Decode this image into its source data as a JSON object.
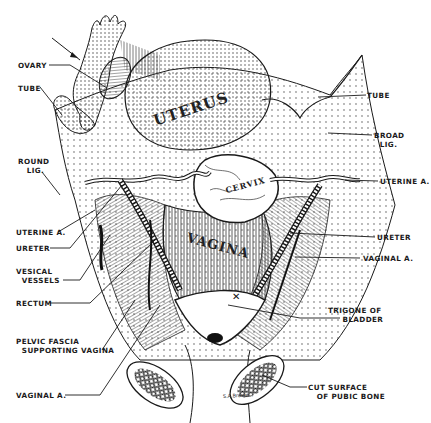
{
  "figure": {
    "type": "anatomical-illustration",
    "style": "black and white stippled pen-and-ink drawing",
    "colors": {
      "ink": "#1a1a1a",
      "background": "#ffffff",
      "stipple": "#3a3a3a"
    }
  },
  "organ_labels": {
    "uterus": "UTERUS",
    "cervix": "CERVIX",
    "vagina": "VAGINA"
  },
  "left_labels": [
    {
      "id": "ovary",
      "text": "OVARY"
    },
    {
      "id": "tube",
      "text": "TUBE"
    },
    {
      "id": "round_lig",
      "text": "ROUND\n   LIG."
    },
    {
      "id": "uterine_a",
      "text": "UTERINE A."
    },
    {
      "id": "ureter",
      "text": "URETER"
    },
    {
      "id": "vesical_vessels",
      "text": "VESICAL\n  VESSELS"
    },
    {
      "id": "rectum",
      "text": "RECTUM"
    },
    {
      "id": "pelvic_fascia",
      "text": "PELVIC FASCIA\n  SUPPORTING VAGINA"
    },
    {
      "id": "vaginal_a",
      "text": "VAGINAL A."
    }
  ],
  "right_labels": [
    {
      "id": "tube",
      "text": "TUBE"
    },
    {
      "id": "broad_lig",
      "text": "BROAD\n  LIG."
    },
    {
      "id": "uterine_a",
      "text": "UTERINE A."
    },
    {
      "id": "ureter",
      "text": "URETER"
    },
    {
      "id": "vaginal_a",
      "text": "VAGINAL A."
    },
    {
      "id": "trigone",
      "text": "TRIGONE OF\n     BLADDER"
    },
    {
      "id": "cut_surface",
      "text": "CUT SURFACE\n   OF PUBIC BONE"
    }
  ]
}
